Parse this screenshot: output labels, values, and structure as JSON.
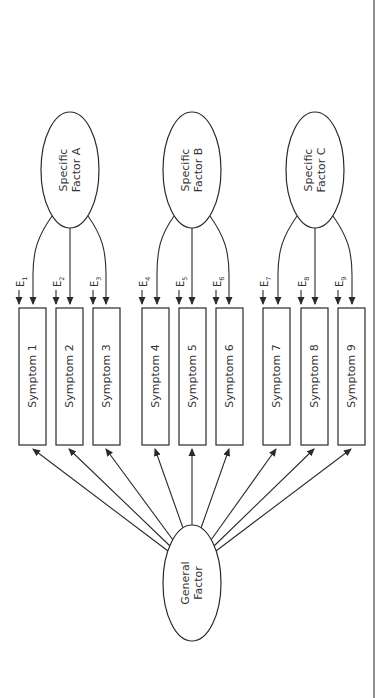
{
  "diagram": {
    "type": "bifactor-model",
    "orientation": "rotated-90",
    "general_factor": {
      "line1": "General",
      "line2": "Factor"
    },
    "specific_factors": [
      {
        "id": "A",
        "line1": "Specific",
        "line2": "Factor A",
        "symptoms": [
          1,
          2,
          3
        ]
      },
      {
        "id": "B",
        "line1": "Specific",
        "line2": "Factor B",
        "symptoms": [
          4,
          5,
          6
        ]
      },
      {
        "id": "C",
        "line1": "Specific",
        "line2": "Factor C",
        "symptoms": [
          7,
          8,
          9
        ]
      }
    ],
    "symptoms": [
      {
        "label": "Symptom 1",
        "error": "E",
        "error_sub": "1"
      },
      {
        "label": "Symptom 2",
        "error": "E",
        "error_sub": "2"
      },
      {
        "label": "Symptom 3",
        "error": "E",
        "error_sub": "3"
      },
      {
        "label": "Symptom 4",
        "error": "E",
        "error_sub": "4"
      },
      {
        "label": "Symptom 5",
        "error": "E",
        "error_sub": "5"
      },
      {
        "label": "Symptom 6",
        "error": "E",
        "error_sub": "6"
      },
      {
        "label": "Symptom 7",
        "error": "E",
        "error_sub": "7"
      },
      {
        "label": "Symptom 8",
        "error": "E",
        "error_sub": "8"
      },
      {
        "label": "Symptom 9",
        "error": "E",
        "error_sub": "9"
      }
    ]
  },
  "colors": {
    "stroke": "#2a2a2a",
    "text": "#333333",
    "background": "#ffffff"
  }
}
